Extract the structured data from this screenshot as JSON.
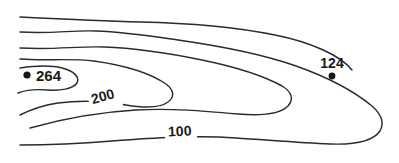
{
  "figure": {
    "kind": "contour-map",
    "background_color": "#ffffff",
    "line_color": "#2b2b2b",
    "label_color": "#1a1a1a",
    "width": 399,
    "height": 163
  },
  "chart_data": {
    "type": "line",
    "title": "",
    "subtitle": "",
    "xlabel": "",
    "ylabel": "",
    "grid": false,
    "legend": false,
    "axis_visible": false,
    "xlim": [
      0,
      399
    ],
    "ylim": [
      0,
      163
    ],
    "contour_labels": [
      {
        "name": "contour-label-200",
        "text": "200",
        "x": 104,
        "y": 101,
        "rotation": -16,
        "font_size": 14
      },
      {
        "name": "contour-label-100",
        "text": "100",
        "x": 180,
        "y": 136,
        "rotation": -3,
        "font_size": 14
      }
    ],
    "stations": [
      {
        "name": "station-264",
        "label": "264",
        "value": 264,
        "dot_x": 27,
        "dot_y": 75,
        "label_x": 36,
        "label_y": 81,
        "font_size": 15,
        "dot_radius": 3.6
      },
      {
        "name": "station-124",
        "label": "124",
        "value": 124,
        "dot_x": 332,
        "dot_y": 76,
        "label_x": 332,
        "label_y": 68,
        "font_size": 14,
        "dot_radius": 3.4
      }
    ],
    "contours": [
      {
        "name": "contour-outer-top",
        "level": null,
        "path": "M 20 17 C 60 19, 100 21, 140 22 C 190 23, 240 28, 275 35 C 310 42, 340 55, 352 70"
      },
      {
        "name": "contour-100",
        "level": 100,
        "path": "M 20 32 C 52 34, 72 30, 96 31 C 124 32, 150 36, 178 40 C 220 46, 262 54, 296 66 C 330 78, 355 92, 372 106 C 381 114, 385 122, 380 131 C 373 141, 356 145, 330 144 C 300 143, 268 140, 236 138 C 196 135, 152 138, 112 141 C 76 144, 44 145, 20 145"
      },
      {
        "name": "contour-middle-upper",
        "level": null,
        "path": "M 20 48 C 54 50, 78 46, 104 47 C 136 48, 168 53, 202 60 C 236 67, 264 76, 282 86 C 292 92, 294 99, 288 106 C 280 114, 262 116, 238 114 C 204 111, 170 108, 136 110 C 100 112, 62 119, 30 128"
      },
      {
        "name": "contour-200",
        "level": 200,
        "path": "M 20 59 C 46 61, 70 58, 94 61 C 122 65, 150 73, 166 84 C 174 90, 175 97, 168 102 C 160 108, 144 108, 126 105 C 104 101, 80 100, 58 103 C 44 105, 30 110, 20 115"
      },
      {
        "name": "contour-264",
        "level": 264,
        "path": "M 20 68 C 34 66, 50 65, 62 68 C 74 71, 80 77, 77 83 C 73 89, 60 91, 48 90 C 36 89, 26 90, 18 93"
      }
    ]
  }
}
